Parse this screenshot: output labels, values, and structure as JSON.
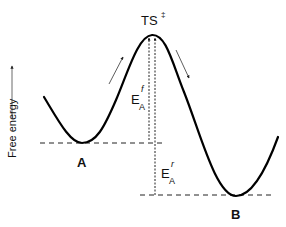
{
  "diagram": {
    "y_axis_label": "Free energy",
    "transition_state": {
      "label": "TS",
      "superscript": "‡"
    },
    "states": [
      {
        "id": "A",
        "label": "A"
      },
      {
        "id": "B",
        "label": "B"
      }
    ],
    "activation_energies": [
      {
        "id": "forward",
        "base": "E",
        "sub": "A",
        "sup": "f"
      },
      {
        "id": "reverse",
        "base": "E",
        "sub": "A",
        "sup": "r"
      }
    ],
    "direction_arrows": [
      "uphill-forward",
      "downhill-forward"
    ],
    "colors": {
      "curve": "#000000",
      "lines": "#222222",
      "text": "#111111"
    }
  }
}
